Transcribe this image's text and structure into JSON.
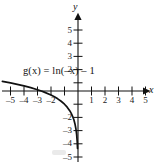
{
  "figure": {
    "width": 156,
    "height": 163,
    "background": "#ffffff",
    "ink_color": "#111111"
  },
  "axes": {
    "x_axis_name": "x",
    "y_axis_name": "y",
    "x_tick_labels": [
      "–5",
      "–4",
      "–3",
      "–2",
      "1",
      "2",
      "3",
      "4",
      "5"
    ],
    "y_tick_labels": [
      "5",
      "4",
      "3",
      "2",
      "–2",
      "–3",
      "–4",
      "–5"
    ]
  },
  "curve_label": {
    "function_name": "g",
    "variable": "x",
    "full_text": "g(x) = ln(–x) – 1"
  },
  "chart_data": {
    "type": "line",
    "title": "",
    "xlabel": "x",
    "ylabel": "y",
    "xlim": [
      -5.7,
      5.7
    ],
    "ylim": [
      -5.9,
      5.6
    ],
    "grid": false,
    "legend": "none",
    "annotations": [
      {
        "text": "g(x) = ln(–x) – 1",
        "x": -4.0,
        "y": 1.35
      }
    ],
    "xticks": [
      -5,
      -4,
      -3,
      -2,
      -1,
      1,
      2,
      3,
      4,
      5
    ],
    "xticklabels": [
      "–5",
      "–4",
      "–3",
      "–2",
      "",
      "1",
      "2",
      "3",
      "4",
      "5"
    ],
    "yticks": [
      5,
      4,
      3,
      2,
      1,
      -1,
      -2,
      -3,
      -4,
      -5
    ],
    "yticklabels": [
      "5",
      "4",
      "3",
      "2",
      "",
      "",
      "–2",
      "–3",
      "–4",
      "–5"
    ],
    "series": [
      {
        "name": "g(x) = ln(–x) – 1",
        "equation": "y = ln(-x) - 1",
        "domain": [
          -5.6,
          -0.03
        ],
        "asymptote_x": 0,
        "x_intercept": -2.718,
        "color": "#111111",
        "x": [
          -5.6,
          -5.0,
          -4.5,
          -4.0,
          -3.5,
          -3.0,
          -2.72,
          -2.5,
          -2.0,
          -1.75,
          -1.5,
          -1.25,
          -1.0,
          -0.8,
          -0.6,
          -0.5,
          -0.4,
          -0.3,
          -0.22,
          -0.15,
          -0.1,
          -0.06,
          -0.035
        ],
        "y": [
          0.723,
          0.609,
          0.504,
          0.386,
          0.253,
          0.099,
          0.0,
          -0.084,
          -0.307,
          -0.44,
          -0.595,
          -0.777,
          -1.0,
          -1.223,
          -1.511,
          -1.693,
          -1.916,
          -2.204,
          -2.514,
          -2.897,
          -3.303,
          -3.813,
          -4.354
        ]
      }
    ]
  }
}
